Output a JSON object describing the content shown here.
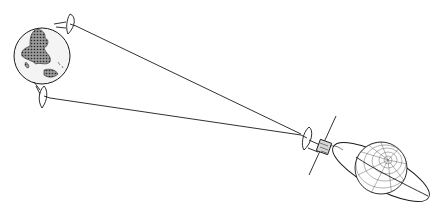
{
  "diagram": {
    "subject": "Deep space communication link",
    "elements": {
      "earth": "Earth",
      "ground_station_top": "Ground station antenna (uplink)",
      "ground_station_bottom": "Ground station antenna (downlink)",
      "spacecraft": "Spacecraft with high-gain antenna",
      "planet": "Target planet",
      "orbit": "Spacecraft orbit"
    },
    "colors": {
      "ink": "#1a1a1a",
      "background": "#ffffff",
      "earth_fill": "#f2f2f2",
      "land_fill": "#6a6a6a"
    }
  }
}
